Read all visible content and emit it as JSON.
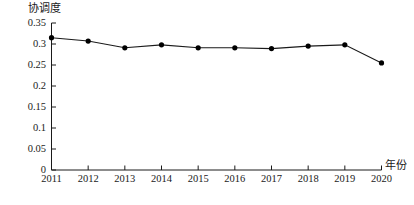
{
  "chart_data": {
    "type": "line",
    "title": "",
    "ylabel": "协调度",
    "xlabel": "年份",
    "categories": [
      "2011",
      "2012",
      "2013",
      "2014",
      "2015",
      "2016",
      "2017",
      "2018",
      "2019",
      "2020"
    ],
    "values": [
      0.315,
      0.307,
      0.291,
      0.298,
      0.291,
      0.291,
      0.289,
      0.295,
      0.298,
      0.255
    ],
    "ylim": [
      0,
      0.35
    ],
    "yticks": [
      "0",
      "0.05",
      "0.1",
      "0.15",
      "0.2",
      "0.25",
      "0.3",
      "0.35"
    ],
    "ytick_values": [
      0,
      0.05,
      0.1,
      0.15,
      0.2,
      0.25,
      0.3,
      0.35
    ],
    "grid": false,
    "legend": false,
    "legend_position": "none",
    "series_color": "#1a1a1a",
    "marker": "circle",
    "marker_color": "#000000",
    "axis_color": "#1a1a1a"
  },
  "axes": {
    "y_title": "协调度",
    "x_title": "年份"
  }
}
